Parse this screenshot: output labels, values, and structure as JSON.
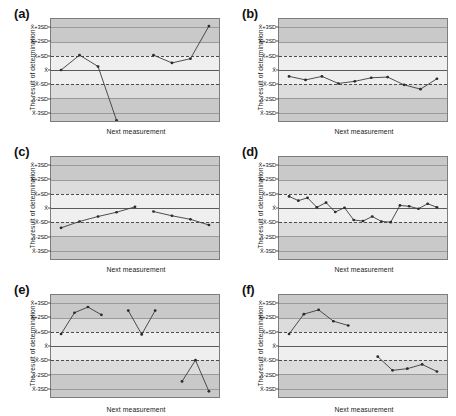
{
  "figure": {
    "axis_titles": {
      "y": "The result of determination",
      "x": "Next measurement"
    },
    "y_ticks": [
      "X̄+3SD",
      "X̄+2SD",
      "X̄+SD",
      "X̄",
      "X̄-SD",
      "X̄-2SD",
      "X̄-3SD"
    ],
    "colors": {
      "outer_band": "#c9c9c9",
      "mid_band": "#dcdcdc",
      "inner_band": "#efefef",
      "line": "#3b3b3b",
      "marker": "#2b2b2b",
      "control_limit_line": "#4d4d4d",
      "mean_line": "#5a5a5a",
      "plot_border": "#7d7d7d"
    }
  },
  "chart_data": [
    {
      "type": "line",
      "panel": "(a)",
      "title": "(a)",
      "xlabel": "Next measurement",
      "ylabel": "The result of determination",
      "ylim": [
        -3.6,
        3.6
      ],
      "ytick_labels": [
        "X̄+3SD",
        "X̄+2SD",
        "X̄+SD",
        "X̄",
        "X̄-SD",
        "X̄-2SD",
        "X̄-3SD"
      ],
      "ytick_values": [
        3,
        2,
        1,
        0,
        -1,
        -2,
        -3
      ],
      "grid": true,
      "legend": "none",
      "series": [
        {
          "name": "segment-1",
          "x": [
            1,
            2,
            3,
            4
          ],
          "values": [
            0.0,
            1.05,
            0.25,
            -3.55
          ]
        },
        {
          "name": "segment-2",
          "x": [
            6,
            7,
            8,
            9
          ],
          "values": [
            1.05,
            0.5,
            0.8,
            3.1
          ]
        }
      ]
    },
    {
      "type": "line",
      "panel": "(b)",
      "title": "(b)",
      "xlabel": "Next measurement",
      "ylabel": "The result of determination",
      "ylim": [
        -3.6,
        3.6
      ],
      "ytick_labels": [
        "X̄+3SD",
        "X̄+2SD",
        "X̄+SD",
        "X̄",
        "X̄-SD",
        "X̄-2SD",
        "X̄-3SD"
      ],
      "ytick_values": [
        3,
        2,
        1,
        0,
        -1,
        -2,
        -3
      ],
      "grid": true,
      "legend": "none",
      "series": [
        {
          "name": "segment-1",
          "x": [
            1,
            2,
            3,
            4,
            5,
            6,
            7,
            8,
            9,
            10
          ],
          "values": [
            -0.45,
            -0.7,
            -0.45,
            -0.95,
            -0.8,
            -0.55,
            -0.5,
            -1.05,
            -1.35,
            -0.62
          ]
        }
      ]
    },
    {
      "type": "line",
      "panel": "(c)",
      "title": "(c)",
      "xlabel": "Next measurement",
      "ylabel": "The result of determination",
      "ylim": [
        -3.6,
        3.6
      ],
      "ytick_labels": [
        "X̄+3SD",
        "X̄+2SD",
        "X̄+SD",
        "X̄",
        "X̄-SD",
        "X̄-2SD",
        "X̄-3SD"
      ],
      "ytick_values": [
        3,
        2,
        1,
        0,
        -1,
        -2,
        -3
      ],
      "grid": true,
      "legend": "none",
      "series": [
        {
          "name": "segment-1",
          "x": [
            1,
            2,
            3,
            4,
            5
          ],
          "values": [
            -1.4,
            -0.95,
            -0.6,
            -0.3,
            0.08
          ]
        },
        {
          "name": "segment-2",
          "x": [
            6,
            7,
            8,
            9
          ],
          "values": [
            -0.25,
            -0.55,
            -0.8,
            -1.2
          ]
        }
      ]
    },
    {
      "type": "line",
      "panel": "(d)",
      "title": "(d)",
      "xlabel": "Next measurement",
      "ylabel": "The result of determination",
      "ylim": [
        -3.6,
        3.6
      ],
      "ytick_labels": [
        "X̄+3SD",
        "X̄+2SD",
        "X̄+SD",
        "X̄",
        "X̄-SD",
        "X̄-2SD",
        "X̄-3SD"
      ],
      "ytick_values": [
        3,
        2,
        1,
        0,
        -1,
        -2,
        -3
      ],
      "grid": true,
      "legend": "none",
      "series": [
        {
          "name": "segment-1",
          "x": [
            1,
            2,
            3,
            4,
            5,
            6,
            7,
            8,
            9,
            10,
            11,
            12,
            13,
            14,
            15,
            16,
            17
          ],
          "values": [
            0.82,
            0.52,
            0.72,
            0.05,
            0.38,
            -0.28,
            0.02,
            -0.85,
            -0.92,
            -0.6,
            -0.95,
            -1.0,
            0.18,
            0.12,
            -0.05,
            0.3,
            0.05
          ]
        }
      ]
    },
    {
      "type": "line",
      "panel": "(e)",
      "title": "(e)",
      "xlabel": "Next measurement",
      "ylabel": "The result of determination",
      "ylim": [
        -3.6,
        3.6
      ],
      "ytick_labels": [
        "X̄+3SD",
        "X̄+2SD",
        "X̄+SD",
        "X̄",
        "X̄-SD",
        "X̄-2SD",
        "X̄-3SD"
      ],
      "ytick_values": [
        3,
        2,
        1,
        0,
        -1,
        -2,
        -3
      ],
      "grid": true,
      "legend": "none",
      "series": [
        {
          "name": "segment-1",
          "x": [
            1,
            2,
            3,
            4
          ],
          "values": [
            0.85,
            2.35,
            2.75,
            2.2
          ]
        },
        {
          "name": "segment-2",
          "x": [
            6,
            7,
            8
          ],
          "values": [
            2.5,
            0.82,
            2.5
          ]
        },
        {
          "name": "segment-3",
          "x": [
            10,
            11,
            12
          ],
          "values": [
            -2.5,
            -1.0,
            -3.2
          ]
        }
      ]
    },
    {
      "type": "line",
      "panel": "(f)",
      "title": "(f)",
      "xlabel": "Next measurement",
      "ylabel": "The result of determination",
      "ylim": [
        -3.6,
        3.6
      ],
      "ytick_labels": [
        "X̄+3SD",
        "X̄+2SD",
        "X̄+SD",
        "X̄",
        "X̄-SD",
        "X̄-2SD",
        "X̄-3SD"
      ],
      "ytick_values": [
        3,
        2,
        1,
        0,
        -1,
        -2,
        -3
      ],
      "grid": true,
      "legend": "none",
      "series": [
        {
          "name": "segment-1",
          "x": [
            1,
            2,
            3,
            4,
            5
          ],
          "values": [
            0.85,
            2.25,
            2.55,
            1.75,
            1.45
          ]
        },
        {
          "name": "segment-2",
          "x": [
            7,
            8,
            9,
            10,
            11
          ],
          "values": [
            -0.75,
            -1.72,
            -1.6,
            -1.3,
            -1.8
          ]
        }
      ]
    }
  ]
}
